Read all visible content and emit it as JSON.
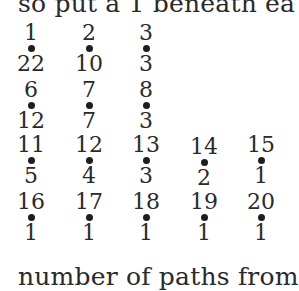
{
  "text": {
    "top_line": "so put a 1 beneath ea",
    "bottom_line": "number of paths from"
  },
  "grid": {
    "rows": [
      {
        "cells": [
          {
            "label": "1",
            "value": "22"
          },
          {
            "label": "2",
            "value": "10"
          },
          {
            "label": "3",
            "value": "3"
          }
        ]
      },
      {
        "cells": [
          {
            "label": "6",
            "value": "12"
          },
          {
            "label": "7",
            "value": "7"
          },
          {
            "label": "8",
            "value": "3"
          }
        ]
      },
      {
        "cells": [
          {
            "label": "11",
            "value": "5"
          },
          {
            "label": "12",
            "value": "4"
          },
          {
            "label": "13",
            "value": "3"
          },
          {
            "label": "14",
            "value": "2"
          },
          {
            "label": "15",
            "value": "1"
          }
        ]
      },
      {
        "cells": [
          {
            "label": "16",
            "value": "1"
          },
          {
            "label": "17",
            "value": "1"
          },
          {
            "label": "18",
            "value": "1"
          },
          {
            "label": "19",
            "value": "1"
          },
          {
            "label": "20",
            "value": "1"
          }
        ]
      }
    ]
  }
}
